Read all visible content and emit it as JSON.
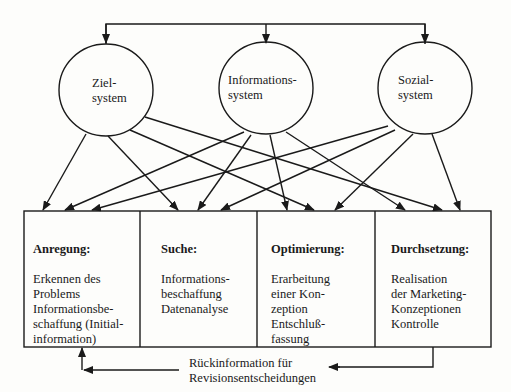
{
  "nodes": {
    "ziel": {
      "label_line1": "Ziel-",
      "label_line2": "system"
    },
    "informations": {
      "label_line1": "Informations-",
      "label_line2": "system"
    },
    "sozial": {
      "label_line1": "Sozial-",
      "label_line2": "system"
    }
  },
  "phases": [
    {
      "title": "Anregung:",
      "body": "Erkennen des\nProblems\nInformationsbe-\nschaffung (Initial-\ninformation)"
    },
    {
      "title": "Suche:",
      "body": "Informations-\nbeschaffung\nDatenanalyse"
    },
    {
      "title": "Optimierung:",
      "body": "Erarbeitung\neiner Kon-\nzeption\nEntschluß-\nfassung"
    },
    {
      "title": "Durchsetzung:",
      "body": "Realisation\nder Marketing-\nKonzeptionen\nKontrolle"
    }
  ],
  "feedback": {
    "line1": "Rückinformation für",
    "line2": "Revisionsentscheidungen"
  },
  "edges": [
    {
      "from": "top-bus",
      "to": "ziel"
    },
    {
      "from": "top-bus",
      "to": "informations"
    },
    {
      "from": "top-bus",
      "to": "sozial"
    },
    {
      "from": "ziel",
      "to": "phase-1"
    },
    {
      "from": "ziel",
      "to": "phase-2"
    },
    {
      "from": "ziel",
      "to": "phase-3"
    },
    {
      "from": "ziel",
      "to": "phase-4"
    },
    {
      "from": "informations",
      "to": "phase-1"
    },
    {
      "from": "informations",
      "to": "phase-2"
    },
    {
      "from": "informations",
      "to": "phase-3"
    },
    {
      "from": "informations",
      "to": "phase-4"
    },
    {
      "from": "sozial",
      "to": "phase-1"
    },
    {
      "from": "sozial",
      "to": "phase-2"
    },
    {
      "from": "sozial",
      "to": "phase-3"
    },
    {
      "from": "sozial",
      "to": "phase-4"
    },
    {
      "from": "phase-4",
      "to": "phase-1",
      "label": "feedback"
    }
  ]
}
